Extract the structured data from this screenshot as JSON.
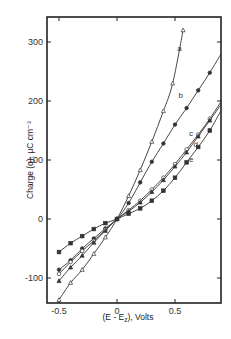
{
  "chart_data": {
    "type": "line",
    "title": "",
    "xlabel": "(E - E_z), Volts",
    "xlabel_main": "(E - E",
    "xlabel_sub": "z",
    "xlabel_tail": "), Volts",
    "ylabel": "Charge (q), μC cm⁻²",
    "xlim": [
      -0.59,
      0.9
    ],
    "ylim": [
      -142,
      342
    ],
    "xticks": [
      -0.5,
      0,
      0.5
    ],
    "xtick_labels": [
      "-0.5",
      "0",
      "0.5"
    ],
    "yticks": [
      -100,
      0,
      100,
      200,
      300
    ],
    "ytick_labels": [
      "-100",
      "0",
      "100",
      "200",
      "300"
    ],
    "grid": false,
    "legend": "inline curve labels",
    "series": [
      {
        "name": "a",
        "marker": "open-triangle",
        "x": [
          -0.5,
          -0.4,
          -0.3,
          -0.2,
          -0.1,
          0,
          0.1,
          0.2,
          0.3,
          0.4,
          0.48,
          0.57
        ],
        "values": [
          -137,
          -108,
          -86,
          -59,
          -31,
          0,
          39,
          83,
          131,
          183,
          230,
          320
        ],
        "label_pos": [
          0.52,
          285
        ]
      },
      {
        "name": "b",
        "marker": "filled-circle",
        "x": [
          -0.5,
          -0.4,
          -0.3,
          -0.2,
          -0.1,
          0,
          0.1,
          0.2,
          0.3,
          0.4,
          0.5,
          0.6,
          0.7,
          0.8,
          0.9
        ],
        "values": [
          -86,
          -70,
          -50,
          -33,
          -16,
          0,
          27,
          62,
          97,
          128,
          160,
          188,
          218,
          248,
          281
        ],
        "label_pos": [
          0.53,
          205
        ]
      },
      {
        "name": "c",
        "marker": "open-circle",
        "x": [
          -0.5,
          -0.4,
          -0.3,
          -0.2,
          -0.1,
          0,
          0.1,
          0.2,
          0.3,
          0.4,
          0.5,
          0.6,
          0.7,
          0.8,
          0.9
        ],
        "values": [
          -93,
          -73,
          -54,
          -37,
          -18,
          0,
          15,
          31,
          50,
          70,
          93,
          118,
          143,
          170,
          200
        ],
        "label_pos": [
          0.62,
          140
        ]
      },
      {
        "name": "d",
        "marker": "filled-triangle",
        "x": [
          -0.5,
          -0.4,
          -0.3,
          -0.2,
          -0.1,
          0,
          0.1,
          0.2,
          0.3,
          0.4,
          0.5,
          0.6,
          0.7,
          0.8,
          0.9
        ],
        "values": [
          -105,
          -82,
          -62,
          -40,
          -20,
          0,
          13,
          28,
          46,
          66,
          89,
          113,
          140,
          167,
          195
        ],
        "label_pos": [
          0.66,
          122
        ]
      },
      {
        "name": "e",
        "marker": "filled-square",
        "x": [
          -0.5,
          -0.4,
          -0.3,
          -0.2,
          -0.1,
          0,
          0.1,
          0.2,
          0.3,
          0.4,
          0.5,
          0.6,
          0.7,
          0.8,
          0.9
        ],
        "values": [
          -56,
          -41,
          -29,
          -17,
          -7,
          0,
          9,
          18,
          31,
          48,
          70,
          96,
          122,
          150,
          185
        ],
        "label_pos": [
          0.62,
          96
        ]
      }
    ]
  }
}
